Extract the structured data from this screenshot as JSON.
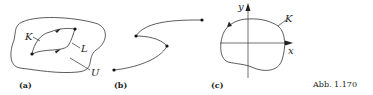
{
  "figure": {
    "caption": "Abb. 1.170",
    "panels": [
      {
        "id": "a",
        "label": "(a)",
        "curve_labels": [
          "K",
          "L"
        ],
        "region_label": "U"
      },
      {
        "id": "b",
        "label": "(b)"
      },
      {
        "id": "c",
        "label": "(c)",
        "curve_label": "K",
        "axes": {
          "x": "x",
          "y": "y"
        }
      }
    ]
  },
  "colors": {
    "stroke": "#333333",
    "text": "#222222"
  }
}
